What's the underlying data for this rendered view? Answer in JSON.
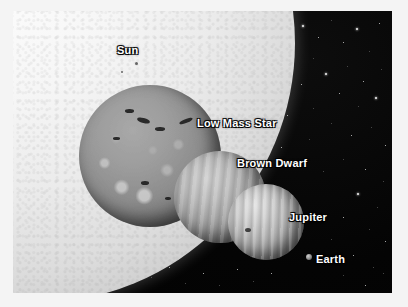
{
  "figure": {
    "kind": "size-comparison-diagram",
    "palette": {
      "background": "#030303",
      "frame": "#ffffff",
      "label_text": "#ffffff",
      "sun_bright": "#fdfdfd",
      "low_mass_star": "#9c9c9c",
      "brown_dwarf": "#bdbdbd",
      "jupiter": "#cdcdcd",
      "earth": "#8a8a8a"
    }
  },
  "labels": {
    "sun": "Sun",
    "low_mass_star": "Low Mass Star",
    "brown_dwarf": "Brown Dwarf",
    "jupiter": "Jupiter",
    "earth": "Earth"
  },
  "objects": [
    {
      "name": "Sun",
      "label": "Sun",
      "relative_size": "largest",
      "appearance": "bright white limb filling the upper left"
    },
    {
      "name": "Low Mass Star",
      "label": "Low Mass Star",
      "relative_size": "large",
      "appearance": "mottled grey sphere with dark starspots"
    },
    {
      "name": "Brown Dwarf",
      "label": "Brown Dwarf",
      "relative_size": "medium",
      "appearance": "banded grey sphere"
    },
    {
      "name": "Jupiter",
      "label": "Jupiter",
      "relative_size": "small",
      "appearance": "banded sphere with a dark spot"
    },
    {
      "name": "Earth",
      "label": "Earth",
      "relative_size": "tiny",
      "appearance": "tiny dot"
    }
  ],
  "starfield": {
    "stars": [
      {
        "x": 262,
        "y": 8,
        "k": "dim"
      },
      {
        "x": 289,
        "y": 14,
        "k": "big"
      },
      {
        "x": 305,
        "y": 26,
        "k": ""
      },
      {
        "x": 318,
        "y": 9,
        "k": "dim"
      },
      {
        "x": 330,
        "y": 31,
        "k": ""
      },
      {
        "x": 343,
        "y": 17,
        "k": "big"
      },
      {
        "x": 356,
        "y": 40,
        "k": "dim"
      },
      {
        "x": 366,
        "y": 12,
        "k": ""
      },
      {
        "x": 300,
        "y": 47,
        "k": "dim"
      },
      {
        "x": 276,
        "y": 38,
        "k": ""
      },
      {
        "x": 312,
        "y": 62,
        "k": "big"
      },
      {
        "x": 334,
        "y": 55,
        "k": "dim"
      },
      {
        "x": 350,
        "y": 70,
        "k": ""
      },
      {
        "x": 368,
        "y": 58,
        "k": "dim"
      },
      {
        "x": 288,
        "y": 73,
        "k": ""
      },
      {
        "x": 263,
        "y": 66,
        "k": "dim"
      },
      {
        "x": 326,
        "y": 82,
        "k": ""
      },
      {
        "x": 345,
        "y": 95,
        "k": "dim"
      },
      {
        "x": 362,
        "y": 86,
        "k": "big"
      },
      {
        "x": 300,
        "y": 97,
        "k": "dim"
      },
      {
        "x": 274,
        "y": 104,
        "k": ""
      },
      {
        "x": 318,
        "y": 112,
        "k": "dim"
      },
      {
        "x": 338,
        "y": 124,
        "k": ""
      },
      {
        "x": 358,
        "y": 116,
        "k": "dim"
      },
      {
        "x": 372,
        "y": 134,
        "k": ""
      },
      {
        "x": 296,
        "y": 128,
        "k": "dim"
      },
      {
        "x": 268,
        "y": 136,
        "k": ""
      },
      {
        "x": 330,
        "y": 148,
        "k": "dim"
      },
      {
        "x": 352,
        "y": 158,
        "k": ""
      },
      {
        "x": 370,
        "y": 170,
        "k": "dim"
      },
      {
        "x": 310,
        "y": 160,
        "k": "dim"
      },
      {
        "x": 344,
        "y": 182,
        "k": "big"
      },
      {
        "x": 364,
        "y": 196,
        "k": "dim"
      },
      {
        "x": 330,
        "y": 206,
        "k": ""
      },
      {
        "x": 356,
        "y": 218,
        "k": "dim"
      },
      {
        "x": 372,
        "y": 230,
        "k": ""
      },
      {
        "x": 318,
        "y": 228,
        "k": "dim"
      },
      {
        "x": 340,
        "y": 244,
        "k": ""
      },
      {
        "x": 360,
        "y": 256,
        "k": "dim"
      },
      {
        "x": 330,
        "y": 264,
        "k": "dim"
      },
      {
        "x": 352,
        "y": 274,
        "k": ""
      },
      {
        "x": 370,
        "y": 262,
        "k": "dim"
      },
      {
        "x": 16,
        "y": 176,
        "k": "dim"
      },
      {
        "x": 30,
        "y": 190,
        "k": ""
      },
      {
        "x": 48,
        "y": 182,
        "k": "dim"
      },
      {
        "x": 22,
        "y": 206,
        "k": "big"
      },
      {
        "x": 44,
        "y": 214,
        "k": "dim"
      },
      {
        "x": 62,
        "y": 198,
        "k": ""
      },
      {
        "x": 18,
        "y": 232,
        "k": "dim"
      },
      {
        "x": 36,
        "y": 240,
        "k": ""
      },
      {
        "x": 56,
        "y": 228,
        "k": "dim"
      },
      {
        "x": 74,
        "y": 246,
        "k": ""
      },
      {
        "x": 26,
        "y": 258,
        "k": "dim"
      },
      {
        "x": 48,
        "y": 266,
        "k": ""
      },
      {
        "x": 68,
        "y": 272,
        "k": "dim"
      },
      {
        "x": 88,
        "y": 258,
        "k": ""
      },
      {
        "x": 104,
        "y": 272,
        "k": "dim"
      },
      {
        "x": 120,
        "y": 250,
        "k": ""
      },
      {
        "x": 138,
        "y": 266,
        "k": "dim"
      },
      {
        "x": 156,
        "y": 256,
        "k": ""
      },
      {
        "x": 172,
        "y": 272,
        "k": "dim"
      },
      {
        "x": 190,
        "y": 262,
        "k": ""
      },
      {
        "x": 206,
        "y": 274,
        "k": "dim"
      },
      {
        "x": 224,
        "y": 258,
        "k": ""
      },
      {
        "x": 240,
        "y": 270,
        "k": "dim"
      },
      {
        "x": 258,
        "y": 262,
        "k": ""
      },
      {
        "x": 92,
        "y": 232,
        "k": "dim"
      },
      {
        "x": 112,
        "y": 222,
        "k": ""
      },
      {
        "x": 132,
        "y": 236,
        "k": "dim"
      },
      {
        "x": 152,
        "y": 228,
        "k": "dim"
      },
      {
        "x": 30,
        "y": 150,
        "k": "dim"
      },
      {
        "x": 50,
        "y": 162,
        "k": ""
      }
    ]
  }
}
